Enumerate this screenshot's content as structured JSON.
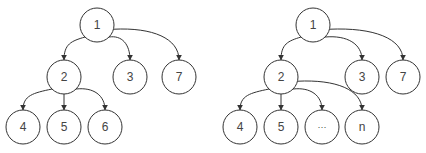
{
  "colors": {
    "stroke": "#333333",
    "label": "#444444",
    "background": "#ffffff"
  },
  "trees": [
    {
      "name": "left-tree",
      "nodes": [
        {
          "id": "1",
          "label": "1",
          "x": 97,
          "y": 25
        },
        {
          "id": "2",
          "label": "2",
          "x": 64,
          "y": 77
        },
        {
          "id": "3",
          "label": "3",
          "x": 130,
          "y": 77
        },
        {
          "id": "7",
          "label": "7",
          "x": 179,
          "y": 77
        },
        {
          "id": "4",
          "label": "4",
          "x": 23,
          "y": 127
        },
        {
          "id": "5",
          "label": "5",
          "x": 64,
          "y": 127
        },
        {
          "id": "6",
          "label": "6",
          "x": 105,
          "y": 127
        }
      ],
      "edges": [
        [
          "1",
          "2"
        ],
        [
          "1",
          "3"
        ],
        [
          "1",
          "7"
        ],
        [
          "2",
          "4"
        ],
        [
          "2",
          "5"
        ],
        [
          "2",
          "6"
        ]
      ]
    },
    {
      "name": "right-tree",
      "nodes": [
        {
          "id": "1",
          "label": "1",
          "x": 313,
          "y": 25
        },
        {
          "id": "2",
          "label": "2",
          "x": 281,
          "y": 77
        },
        {
          "id": "3",
          "label": "3",
          "x": 362,
          "y": 77
        },
        {
          "id": "7",
          "label": "7",
          "x": 403,
          "y": 77
        },
        {
          "id": "4",
          "label": "4",
          "x": 240,
          "y": 127
        },
        {
          "id": "5",
          "label": "5",
          "x": 281,
          "y": 127
        },
        {
          "id": "dots",
          "label": "···",
          "x": 322,
          "y": 127
        },
        {
          "id": "n",
          "label": "n",
          "x": 362,
          "y": 127
        }
      ],
      "edges": [
        [
          "1",
          "2"
        ],
        [
          "1",
          "3"
        ],
        [
          "1",
          "7"
        ],
        [
          "2",
          "4"
        ],
        [
          "2",
          "5"
        ],
        [
          "2",
          "dots"
        ],
        [
          "2",
          "n"
        ]
      ]
    }
  ]
}
